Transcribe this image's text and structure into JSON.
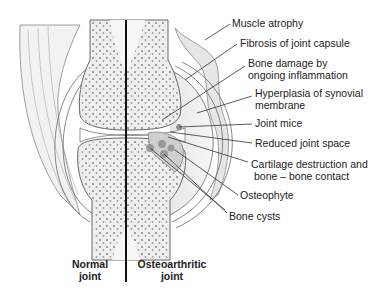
{
  "figure": {
    "type": "anatomical-diagram",
    "labels": [
      {
        "id": "muscle-atrophy",
        "text": "Muscle atrophy"
      },
      {
        "id": "fibrosis",
        "text": "Fibrosis of joint capsule"
      },
      {
        "id": "bone-damage-1",
        "text": "Bone damage by"
      },
      {
        "id": "bone-damage-2",
        "text": "ongoing inflammation"
      },
      {
        "id": "hyperplasia-1",
        "text": "Hyperplasia of synovial"
      },
      {
        "id": "hyperplasia-2",
        "text": "membrane"
      },
      {
        "id": "joint-mice",
        "text": "Joint mice"
      },
      {
        "id": "reduced-space",
        "text": "Reduced joint space"
      },
      {
        "id": "cartilage-1",
        "text": "Cartilage destruction and"
      },
      {
        "id": "cartilage-2",
        "text": "bone – bone contact"
      },
      {
        "id": "osteophyte",
        "text": "Osteophyte"
      },
      {
        "id": "bone-cysts",
        "text": "Bone cysts"
      }
    ],
    "captions": {
      "normal_1": "Normal",
      "normal_2": "joint",
      "oa_1": "Osteoarthritic",
      "oa_2": "joint"
    },
    "colors": {
      "bone_fill": "#ececec",
      "soft_tissue": "#d9d9d9",
      "outline": "#6a6a6a",
      "divider": "#111111",
      "leader": "#333333"
    }
  }
}
